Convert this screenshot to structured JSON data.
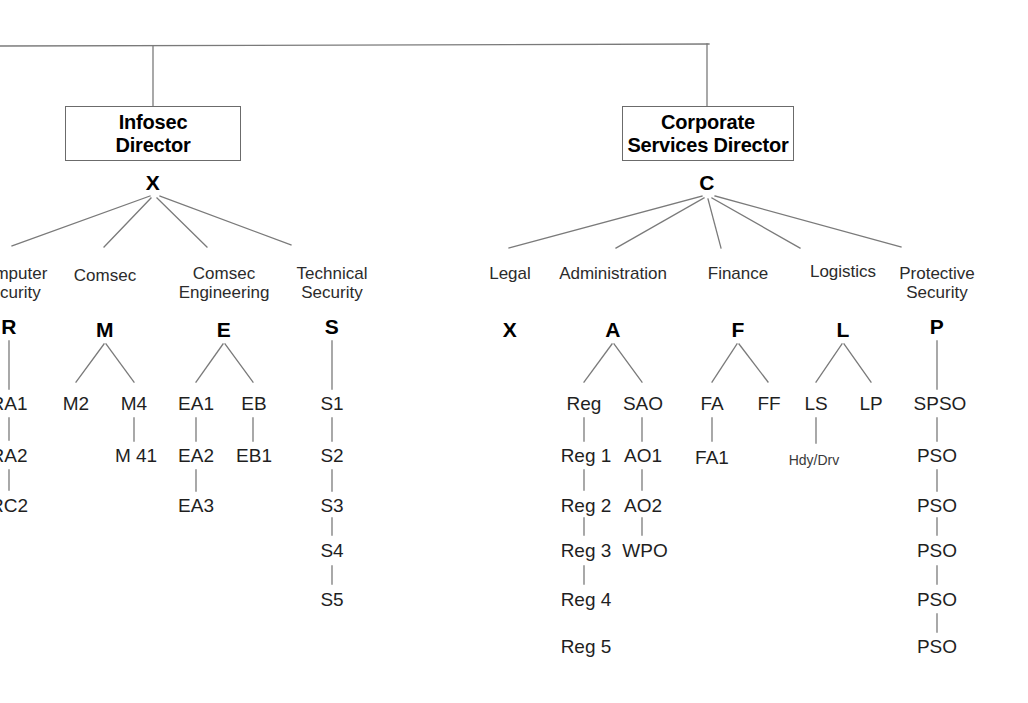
{
  "diagram": {
    "background": "#ffffff",
    "line_color": "#7a7a7a",
    "text_color": "#1a1a1a"
  },
  "top_boxes": [
    {
      "name": "infosec-director",
      "line1": "Infosec",
      "line2": "Director",
      "code": "X"
    },
    {
      "name": "corporate-services-director",
      "line1": "Corporate",
      "line2": "Services Director",
      "code": "C"
    }
  ],
  "branches": [
    {
      "parent": "X",
      "dept_line1": "Computer",
      "dept_line2": "Security",
      "code": "R",
      "clipped": true,
      "chain": [
        "RA1",
        "RA2",
        "RC2"
      ]
    },
    {
      "parent": "X",
      "dept_line1": "Comsec",
      "dept_line2": "",
      "code": "M",
      "children": [
        {
          "label": "M2",
          "chain": []
        },
        {
          "label": "M4",
          "chain": [
            "M 41"
          ]
        }
      ]
    },
    {
      "parent": "X",
      "dept_line1": "Comsec",
      "dept_line2": "Engineering",
      "code": "E",
      "children": [
        {
          "label": "EA1",
          "chain": [
            "EA2",
            "EA3"
          ]
        },
        {
          "label": "EB",
          "chain": [
            "EB1"
          ]
        }
      ]
    },
    {
      "parent": "X",
      "dept_line1": "Technical",
      "dept_line2": "Security",
      "code": "S",
      "chain": [
        "S1",
        "S2",
        "S3",
        "S4",
        "S5"
      ]
    },
    {
      "parent": "C",
      "dept_line1": "Legal",
      "dept_line2": "",
      "code": "X",
      "chain": []
    },
    {
      "parent": "C",
      "dept_line1": "Administration",
      "dept_line2": "",
      "code": "A",
      "children": [
        {
          "label": "Reg",
          "chain": [
            "Reg 1",
            "Reg 2",
            "Reg 3",
            "Reg 4",
            "Reg 5"
          ]
        },
        {
          "label": "SAO",
          "chain": [
            "AO1",
            "AO2",
            "WPO"
          ]
        }
      ]
    },
    {
      "parent": "C",
      "dept_line1": "Finance",
      "dept_line2": "",
      "code": "F",
      "children": [
        {
          "label": "FA",
          "chain": [
            "FA1"
          ]
        },
        {
          "label": "FF",
          "chain": []
        }
      ]
    },
    {
      "parent": "C",
      "dept_line1": "Logistics",
      "dept_line2": "",
      "code": "L",
      "children": [
        {
          "label": "LS",
          "chain": [
            "Hdy/Drv"
          ]
        },
        {
          "label": "LP",
          "chain": []
        }
      ]
    },
    {
      "parent": "C",
      "dept_line1": "Protective",
      "dept_line2": "Security",
      "code": "P",
      "chain": [
        "SPSO",
        "PSO",
        "PSO",
        "PSO",
        "PSO",
        "PSO"
      ]
    }
  ],
  "labels": {
    "b0_dept1": "Computer",
    "b0_dept2": "Security",
    "b0_code": "R",
    "b1_dept1": "Comsec",
    "b1_dept2": "",
    "b1_code": "M",
    "b2_dept1": "Comsec",
    "b2_dept2": "Engineering",
    "b2_code": "E",
    "b3_dept1": "Technical",
    "b3_dept2": "Security",
    "b3_code": "S",
    "b4_dept1": "Legal",
    "b4_dept2": "",
    "b4_code": "X",
    "b5_dept1": "Administration",
    "b5_dept2": "",
    "b5_code": "A",
    "b6_dept1": "Finance",
    "b6_dept2": "",
    "b6_code": "F",
    "b7_dept1": "Logistics",
    "b7_dept2": "",
    "b7_code": "L",
    "b8_dept1": "Protective",
    "b8_dept2": "Security",
    "b8_code": "P",
    "r_a1": "RA1",
    "r_a2": "RA2",
    "r_c2": "RC2",
    "m_2": "M2",
    "m_4": "M4",
    "m_41": "M 41",
    "e_a1": "EA1",
    "e_a2": "EA2",
    "e_a3": "EA3",
    "e_b": "EB",
    "e_b1": "EB1",
    "s_1": "S1",
    "s_2": "S2",
    "s_3": "S3",
    "s_4": "S4",
    "s_5": "S5",
    "reg": "Reg",
    "reg1": "Reg 1",
    "reg2": "Reg 2",
    "reg3": "Reg 3",
    "reg4": "Reg 4",
    "reg5": "Reg 5",
    "sao": "SAO",
    "ao1": "AO1",
    "ao2": "AO2",
    "wpo": "WPO",
    "fa": "FA",
    "fa1": "FA1",
    "ff": "FF",
    "ls": "LS",
    "lp": "LP",
    "hdydrv": "Hdy/Drv",
    "spso": "SPSO",
    "pso1": "PSO",
    "pso2": "PSO",
    "pso3": "PSO",
    "pso4": "PSO",
    "pso5": "PSO"
  }
}
